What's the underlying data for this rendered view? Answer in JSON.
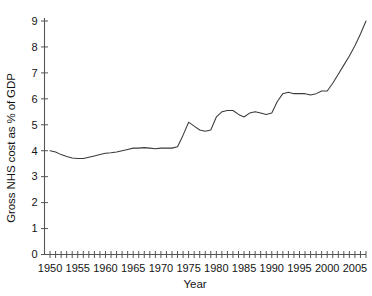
{
  "chart_data": {
    "type": "line",
    "title": "",
    "xlabel": "Year",
    "ylabel": "Gross NHS cost as % of GDP",
    "xlim": [
      1949,
      2007
    ],
    "ylim": [
      0,
      9
    ],
    "grid": false,
    "legend": "none",
    "y_ticks": [
      0,
      1,
      2,
      3,
      4,
      5,
      6,
      7,
      8,
      9
    ],
    "x_tick_labels": [
      1950,
      1955,
      1960,
      1965,
      1970,
      1975,
      1980,
      1985,
      1990,
      1995,
      2000,
      2005
    ],
    "x_minor_tick_interval": 1,
    "line_color": "#3a3a3a",
    "series": [
      {
        "name": "Gross NHS cost as % of GDP",
        "x": [
          1950,
          1951,
          1952,
          1953,
          1954,
          1955,
          1956,
          1957,
          1958,
          1959,
          1960,
          1961,
          1962,
          1963,
          1964,
          1965,
          1966,
          1967,
          1968,
          1969,
          1970,
          1971,
          1972,
          1973,
          1974,
          1975,
          1976,
          1977,
          1978,
          1979,
          1980,
          1981,
          1982,
          1983,
          1984,
          1985,
          1986,
          1987,
          1988,
          1989,
          1990,
          1991,
          1992,
          1993,
          1994,
          1995,
          1996,
          1997,
          1998,
          1999,
          2000,
          2001,
          2002,
          2003,
          2004,
          2005,
          2006,
          2007
        ],
        "values": [
          4.0,
          3.95,
          3.85,
          3.78,
          3.72,
          3.7,
          3.7,
          3.75,
          3.8,
          3.85,
          3.9,
          3.92,
          3.95,
          4.0,
          4.05,
          4.1,
          4.1,
          4.12,
          4.1,
          4.08,
          4.1,
          4.1,
          4.1,
          4.15,
          4.6,
          5.1,
          4.95,
          4.8,
          4.75,
          4.8,
          5.3,
          5.5,
          5.55,
          5.55,
          5.4,
          5.3,
          5.45,
          5.5,
          5.45,
          5.4,
          5.45,
          5.9,
          6.2,
          6.25,
          6.2,
          6.2,
          6.2,
          6.15,
          6.2,
          6.3,
          6.3,
          6.6,
          6.95,
          7.3,
          7.65,
          8.05,
          8.5,
          9.0
        ]
      }
    ]
  },
  "axis": {
    "y_label": "Gross NHS cost as % of GDP",
    "x_label": "Year"
  }
}
